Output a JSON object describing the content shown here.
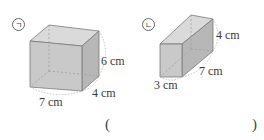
{
  "problem": {
    "figures": [
      {
        "marker": "ㄱ",
        "dimensions": {
          "width": "7 cm",
          "depth": "4 cm",
          "height": "6 cm"
        }
      },
      {
        "marker": "ㄴ",
        "dimensions": {
          "width": "3 cm",
          "depth": "7 cm",
          "height": "4 cm"
        }
      }
    ],
    "answer": {
      "open_paren": "(",
      "close_paren": ")",
      "value": ""
    }
  },
  "colors": {
    "front_face": "#c9c9c9",
    "side_face": "#b7b7b7",
    "top_face": "#dadada",
    "edge": "#7a7a7a",
    "hidden_edge": "#999999"
  }
}
